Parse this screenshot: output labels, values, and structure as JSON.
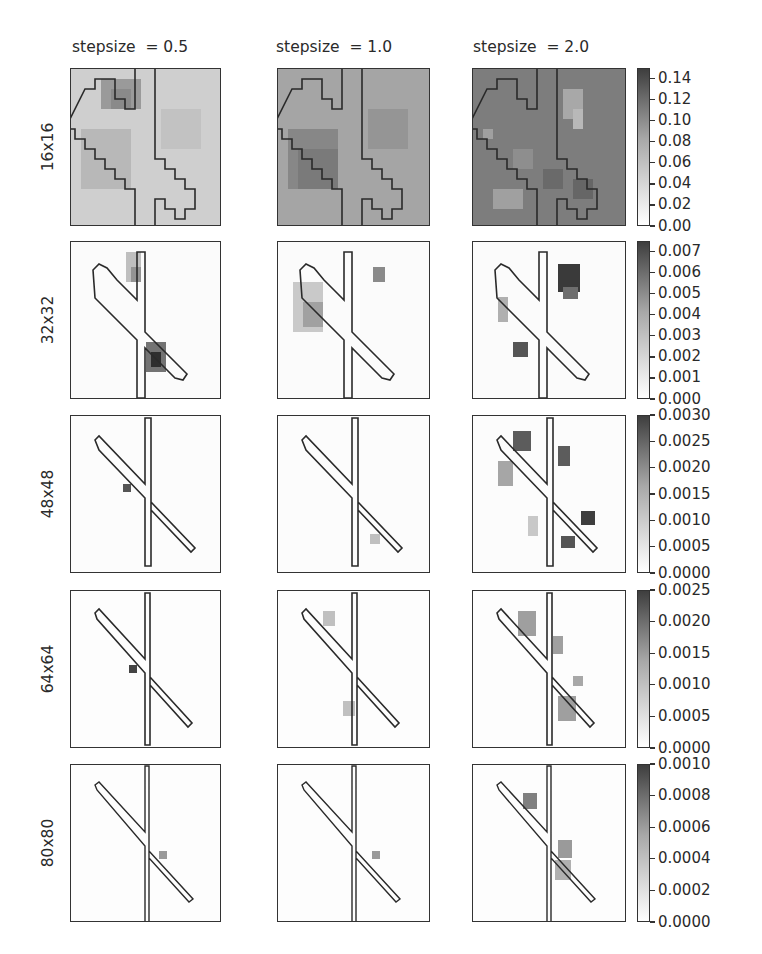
{
  "chart_data": {
    "type": "heatmap",
    "title": "",
    "layout": "5x3 grid of grayscale heatmaps with object outline overlay, per-row colorbar",
    "columns": [
      "stepsize  = 0.5",
      "stepsize  = 1.0",
      "stepsize  = 2.0"
    ],
    "rows": [
      "16x16",
      "32x32",
      "48x48",
      "64x64",
      "80x80"
    ],
    "colormap": "Greys (white = 0, dark = max)",
    "colorbars": [
      {
        "row": "16x16",
        "range": [
          0.0,
          0.15
        ],
        "ticks": [
          "0.00",
          "0.02",
          "0.04",
          "0.06",
          "0.08",
          "0.10",
          "0.12",
          "0.14"
        ]
      },
      {
        "row": "32x32",
        "range": [
          0.0,
          0.0075
        ],
        "ticks": [
          "0.000",
          "0.001",
          "0.002",
          "0.003",
          "0.004",
          "0.005",
          "0.006",
          "0.007"
        ]
      },
      {
        "row": "48x48",
        "range": [
          0.0,
          0.003
        ],
        "ticks": [
          "0.0000",
          "0.0005",
          "0.0010",
          "0.0015",
          "0.0020",
          "0.0025",
          "0.0030"
        ]
      },
      {
        "row": "64x64",
        "range": [
          0.0,
          0.0025
        ],
        "ticks": [
          "0.0000",
          "0.0005",
          "0.0010",
          "0.0015",
          "0.0020",
          "0.0025"
        ]
      },
      {
        "row": "80x80",
        "range": [
          0.0,
          0.001
        ],
        "ticks": [
          "0.0000",
          "0.0002",
          "0.0004",
          "0.0006",
          "0.0008",
          "0.0010"
        ]
      }
    ],
    "panel_descriptions": [
      {
        "row": "16x16",
        "col": "stepsize = 0.5",
        "background_level": 0.04,
        "notes": "light gray, darker blob near top-middle of the outline"
      },
      {
        "row": "16x16",
        "col": "stepsize = 1.0",
        "background_level": 0.07,
        "notes": "medium gray, darker region left of diagonal"
      },
      {
        "row": "16x16",
        "col": "stepsize = 2.0",
        "background_level": 0.1,
        "notes": "dark gray, patchy light and dark blocks"
      },
      {
        "row": "32x32",
        "col": "stepsize = 0.5",
        "notes": "dark blob below crossing on right of vertical bar; lighter blob top"
      },
      {
        "row": "32x32",
        "col": "stepsize = 1.0",
        "notes": "diffuse gray blobs left of diagonal, small blob top right"
      },
      {
        "row": "32x32",
        "col": "stepsize = 2.0",
        "notes": "strong dark blob top right, smaller blob lower left"
      },
      {
        "row": "48x48",
        "col": "stepsize = 0.5",
        "notes": "small dark spot left of crossing"
      },
      {
        "row": "48x48",
        "col": "stepsize = 1.0",
        "notes": "faint spots near lower right"
      },
      {
        "row": "48x48",
        "col": "stepsize = 2.0",
        "notes": "several dark blobs along diagonal"
      },
      {
        "row": "64x64",
        "col": "stepsize = 0.5",
        "notes": "small dark spot at crossing"
      },
      {
        "row": "64x64",
        "col": "stepsize = 1.0",
        "notes": "faint spots along diagonal"
      },
      {
        "row": "64x64",
        "col": "stepsize = 2.0",
        "notes": "gray blobs along diagonal"
      },
      {
        "row": "80x80",
        "col": "stepsize = 0.5",
        "notes": "faint spot right of crossing"
      },
      {
        "row": "80x80",
        "col": "stepsize = 1.0",
        "notes": "faint spot below crossing"
      },
      {
        "row": "80x80",
        "col": "stepsize = 2.0",
        "notes": "gray blobs upper-left and lower-right along diagonal"
      }
    ]
  },
  "labels": {
    "col0": "stepsize  = 0.5",
    "col1": "stepsize  = 1.0",
    "col2": "stepsize  = 2.0",
    "row0": "16x16",
    "row1": "32x32",
    "row2": "48x48",
    "row3": "64x64",
    "row4": "80x80"
  },
  "colorbar_ticks": {
    "r0": [
      "0.14",
      "0.12",
      "0.10",
      "0.08",
      "0.06",
      "0.04",
      "0.02",
      "0.00"
    ],
    "r1": [
      "0.007",
      "0.006",
      "0.005",
      "0.004",
      "0.003",
      "0.002",
      "0.001",
      "0.000"
    ],
    "r2": [
      "0.0030",
      "0.0025",
      "0.0020",
      "0.0015",
      "0.0010",
      "0.0005",
      "0.0000"
    ],
    "r3": [
      "0.0025",
      "0.0020",
      "0.0015",
      "0.0010",
      "0.0005",
      "0.0000"
    ],
    "r4": [
      "0.0010",
      "0.0008",
      "0.0006",
      "0.0004",
      "0.0002",
      "0.0000"
    ]
  }
}
